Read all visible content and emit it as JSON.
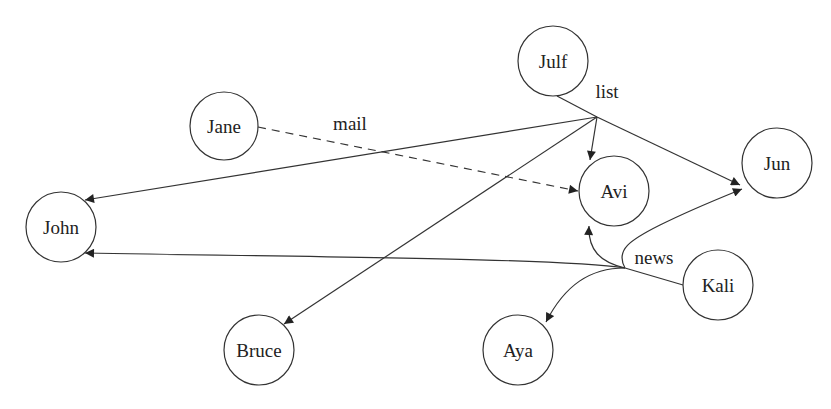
{
  "diagram": {
    "type": "directed-hyperedge-graph",
    "nodes": [
      {
        "id": "julf",
        "label": "Julf"
      },
      {
        "id": "jane",
        "label": "Jane"
      },
      {
        "id": "john",
        "label": "John"
      },
      {
        "id": "avi",
        "label": "Avi"
      },
      {
        "id": "jun",
        "label": "Jun"
      },
      {
        "id": "kali",
        "label": "Kali"
      },
      {
        "id": "bruce",
        "label": "Bruce"
      },
      {
        "id": "aya",
        "label": "Aya"
      }
    ],
    "edges": [
      {
        "id": "list",
        "label": "list",
        "style": "solid",
        "from": [
          "Julf"
        ],
        "to": [
          "John",
          "Bruce",
          "Avi",
          "Jun"
        ]
      },
      {
        "id": "mail",
        "label": "mail",
        "style": "dashed",
        "from": [
          "Jane"
        ],
        "to": [
          "Avi"
        ]
      },
      {
        "id": "news",
        "label": "news",
        "style": "solid",
        "from": [
          "Kali"
        ],
        "to": [
          "John",
          "Avi",
          "Jun",
          "Aya"
        ]
      }
    ]
  }
}
